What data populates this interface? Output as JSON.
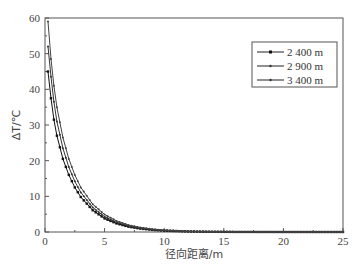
{
  "chart_data": {
    "type": "line",
    "title": "",
    "xlabel": "径向距离/m",
    "ylabel": "ΔT/℃",
    "xlim": [
      0,
      25
    ],
    "ylim": [
      0,
      60
    ],
    "xticks": [
      0,
      5,
      10,
      15,
      20,
      25
    ],
    "yticks": [
      0,
      10,
      20,
      30,
      40,
      50,
      60
    ],
    "grid": false,
    "legend_position": "upper right",
    "x": [
      0.25,
      0.5,
      0.75,
      1,
      1.5,
      2,
      2.5,
      3,
      4,
      5,
      6,
      7,
      8,
      9,
      10,
      12,
      14,
      16,
      18,
      20,
      22,
      24,
      25
    ],
    "series": [
      {
        "name": "2 400 m",
        "marker": "square",
        "values": [
          45,
          37.5,
          31.5,
          27,
          20.5,
          16,
          12.5,
          9.8,
          6.1,
          3.8,
          2.4,
          1.5,
          0.95,
          0.6,
          0.38,
          0.15,
          0.06,
          0.02,
          0.01,
          0,
          0,
          0,
          0
        ]
      },
      {
        "name": "2 900 m",
        "marker": "dot",
        "values": [
          52,
          43.5,
          36.5,
          31,
          23.5,
          18.2,
          14.2,
          11.1,
          6.9,
          4.3,
          2.7,
          1.7,
          1.1,
          0.7,
          0.44,
          0.17,
          0.07,
          0.03,
          0.01,
          0,
          0,
          0,
          0
        ]
      },
      {
        "name": "3 400 m",
        "marker": "dot",
        "values": [
          59,
          48.5,
          41,
          35,
          26.5,
          20.5,
          16,
          12.5,
          7.8,
          4.9,
          3.1,
          1.95,
          1.25,
          0.8,
          0.5,
          0.2,
          0.08,
          0.03,
          0.01,
          0,
          0,
          0,
          0
        ]
      }
    ]
  },
  "axes": {
    "xlabel": "径向距离/m",
    "ylabel": "ΔT/℃"
  },
  "legend": [
    "2 400 m",
    "2 900 m",
    "3 400 m"
  ]
}
